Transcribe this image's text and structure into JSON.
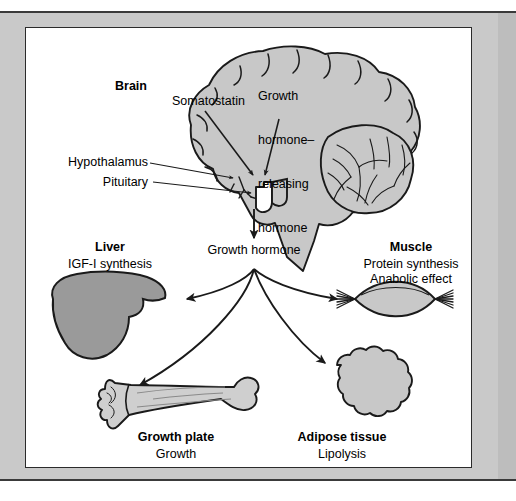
{
  "figure": {
    "kind": "physiology-pathway-diagram",
    "colors": {
      "tissue_fill": "#c8c8c8",
      "organ_fill": "#9a9a9a",
      "bone_fill": "#cfcfcf",
      "outline": "#1a1a1a",
      "mat": "#c9c9c9",
      "panel": "#ffffff",
      "rule": "#3a3a3a"
    }
  },
  "brain": {
    "title": "Brain",
    "somatostatin": "Somatostatin",
    "ghrh_lines": [
      "Growth",
      "hormone–",
      "releasing",
      "hormone"
    ],
    "hypothalamus": "Hypothalamus",
    "pituitary": "Pituitary"
  },
  "central": {
    "growth_hormone": "Growth hormone"
  },
  "targets": [
    {
      "id": "liver",
      "title": "Liver",
      "effects": [
        "IGF-I synthesis"
      ]
    },
    {
      "id": "muscle",
      "title": "Muscle",
      "effects": [
        "Protein synthesis",
        "Anabolic effect"
      ]
    },
    {
      "id": "growth-plate",
      "title": "Growth plate",
      "effects": [
        "Growth"
      ]
    },
    {
      "id": "adipose",
      "title": "Adipose tissue",
      "effects": [
        "Lipolysis"
      ]
    }
  ]
}
